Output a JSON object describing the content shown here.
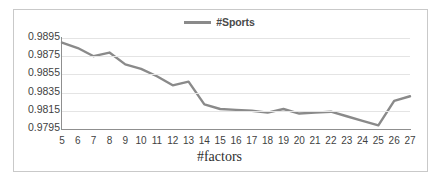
{
  "chart_data": {
    "type": "line",
    "title": "",
    "xlabel": "#factors",
    "ylabel": "",
    "legend_position": "top-center",
    "grid": true,
    "xlim": [
      5,
      27
    ],
    "ylim": [
      0.9795,
      0.9895
    ],
    "categories": [
      5,
      6,
      7,
      8,
      9,
      10,
      11,
      12,
      13,
      14,
      15,
      16,
      17,
      18,
      19,
      20,
      21,
      22,
      23,
      24,
      25,
      26,
      27
    ],
    "x_tick_labels": [
      "5",
      "6",
      "7",
      "8",
      "9",
      "10",
      "11",
      "12",
      "13",
      "14",
      "15",
      "16",
      "17",
      "18",
      "19",
      "20",
      "21",
      "22",
      "23",
      "24",
      "25",
      "26",
      "27"
    ],
    "y_tick_labels": [
      "0.9795",
      "0.9815",
      "0.9835",
      "0.9855",
      "0.9875",
      "0.9895"
    ],
    "y_ticks": [
      0.9795,
      0.9815,
      0.9835,
      0.9855,
      0.9875,
      0.9895
    ],
    "series": [
      {
        "name": "#Sports",
        "color": "#8a8a8a",
        "values": [
          0.989,
          0.9884,
          0.9875,
          0.9879,
          0.9866,
          0.9861,
          0.9853,
          0.9843,
          0.9847,
          0.9822,
          0.9817,
          0.9816,
          0.9815,
          0.9813,
          0.9817,
          0.9812,
          0.9813,
          0.9814,
          0.9809,
          0.9804,
          0.9799,
          0.9826,
          0.9831
        ]
      }
    ]
  },
  "legend": {
    "label": "#Sports"
  },
  "colors": {
    "series_line": "#8a8a8a",
    "axis": "#8f8f8f",
    "grid": "#e4e4e4",
    "text": "#3f3f3f",
    "frame": "#c9c9c9"
  }
}
